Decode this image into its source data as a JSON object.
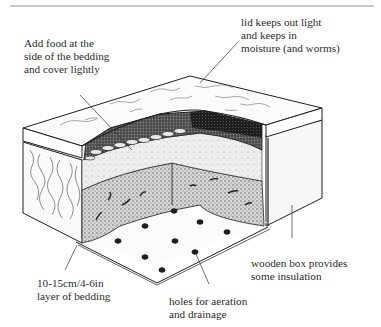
{
  "diagram": {
    "labels": {
      "add_food": "Add food at the\nside of the bedding\nand cover lightly",
      "lid": "lid keeps out light\nand keeps in\nmoisture (and worms)",
      "wooden_box": "wooden box provides\nsome insulation",
      "bedding": "10-15cm/4-6in\nlayer of bedding",
      "holes": "holes for aeration\nand drainage"
    },
    "parts": [
      "lid",
      "wooden box side",
      "food layer",
      "bedding layer",
      "worms",
      "box floor with holes"
    ],
    "hole_count": 10,
    "colors": {
      "ink": "#1e1e1e",
      "paper": "#ffffff",
      "rule": "#c8c8c8",
      "bedding_fill": "#8f8f8f",
      "dark_fill": "#2a2a2a"
    }
  }
}
